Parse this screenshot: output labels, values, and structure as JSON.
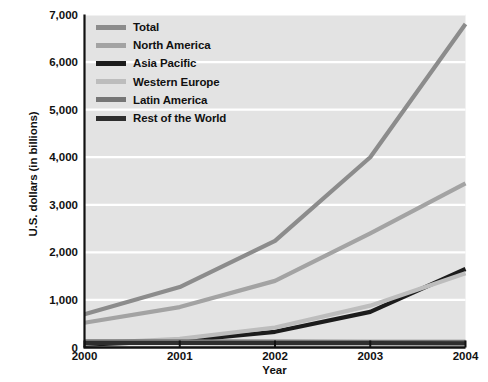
{
  "chart_data": {
    "type": "line",
    "title": "",
    "xlabel": "Year",
    "ylabel": "U.S. dollars (in billions)",
    "categories": [
      "2000",
      "2001",
      "2002",
      "2003",
      "2004"
    ],
    "x": [
      2000,
      2001,
      2002,
      2003,
      2004
    ],
    "ylim": [
      0,
      7000
    ],
    "xlim": [
      2000,
      2004
    ],
    "ytick_labels": [
      "0",
      "1,000",
      "2,000",
      "3,000",
      "4,000",
      "5,000",
      "6,000",
      "7,000"
    ],
    "ytick_values": [
      0,
      1000,
      2000,
      3000,
      4000,
      5000,
      6000,
      7000
    ],
    "xtick_labels": [
      "2000",
      "2001",
      "2002",
      "2003",
      "2004"
    ],
    "grid": "horizontal",
    "legend_position": "inside-top-left",
    "plot_background": "#e3e3e3",
    "gridline_color": "#ffffff",
    "axis_color": "#111111",
    "series": [
      {
        "name": "Total",
        "color": "#8c8c8c",
        "values": [
          700,
          1270,
          2240,
          4000,
          6800
        ]
      },
      {
        "name": "North America",
        "color": "#a3a3a3",
        "values": [
          520,
          850,
          1400,
          2400,
          3450
        ]
      },
      {
        "name": "Asia Pacific",
        "color": "#1c1c1c",
        "values": [
          60,
          140,
          330,
          750,
          1650
        ]
      },
      {
        "name": "Western Europe",
        "color": "#bdbdbd",
        "values": [
          80,
          180,
          420,
          880,
          1560
        ]
      },
      {
        "name": "Latin America",
        "color": "#767676",
        "values": [
          130,
          130,
          125,
          120,
          120
        ]
      },
      {
        "name": "Rest of the World",
        "color": "#2e2e2e",
        "values": [
          95,
          95,
          90,
          90,
          85
        ]
      }
    ]
  }
}
